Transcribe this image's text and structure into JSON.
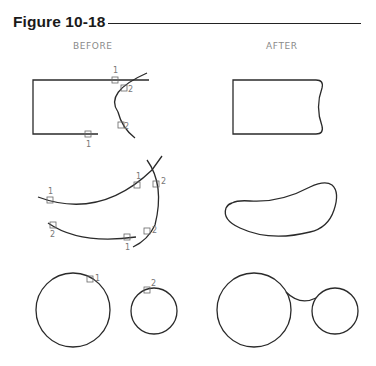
{
  "figure": {
    "title": "Figure 10-18",
    "columns": {
      "before": "BEFORE",
      "after": "AFTER"
    }
  },
  "rows": [
    {
      "name": "line-arc-fillet",
      "before_picks": [
        {
          "label": "1",
          "target": "top line"
        },
        {
          "label": "2",
          "target": "arc upper"
        },
        {
          "label": "2",
          "target": "arc lower"
        },
        {
          "label": "1",
          "target": "bottom line"
        }
      ]
    },
    {
      "name": "arc-arc-fillet",
      "before_picks": [
        {
          "label": "1",
          "target": "upper arc left"
        },
        {
          "label": "1",
          "target": "upper arc right"
        },
        {
          "label": "2",
          "target": "right arc upper"
        },
        {
          "label": "2",
          "target": "lower arc left"
        },
        {
          "label": "1",
          "target": "lower arc right"
        },
        {
          "label": "2",
          "target": "right arc lower"
        }
      ]
    },
    {
      "name": "circle-circle-fillet",
      "before_picks": [
        {
          "label": "1",
          "target": "large circle"
        },
        {
          "label": "2",
          "target": "small circle"
        }
      ]
    }
  ]
}
